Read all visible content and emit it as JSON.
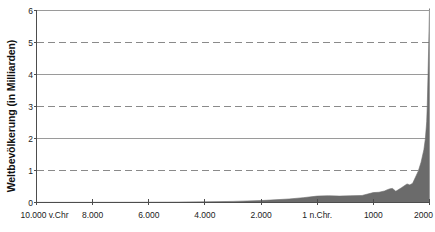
{
  "chart_data": {
    "type": "area",
    "title": "",
    "xlabel": "",
    "ylabel": "Weltbevölkerung (in Milliarden)",
    "ylim": [
      0,
      6
    ],
    "xlim": [
      -10000,
      2000
    ],
    "grid": true,
    "legend": null,
    "series_color": "#6b6b6b",
    "y_ticks": [
      {
        "value": 6,
        "label": "6",
        "gridline": "solid"
      },
      {
        "value": 5,
        "label": "5",
        "gridline": "dashed"
      },
      {
        "value": 4,
        "label": "4",
        "gridline": "solid"
      },
      {
        "value": 3,
        "label": "3",
        "gridline": "dashed"
      },
      {
        "value": 2,
        "label": "2",
        "gridline": "solid"
      },
      {
        "value": 1,
        "label": "1",
        "gridline": "dashed"
      },
      {
        "value": 0,
        "label": "0",
        "gridline": "axis"
      }
    ],
    "x_ticks": [
      {
        "value": -10000,
        "label": "10.000 v.Chr"
      },
      {
        "value": -8000,
        "label": "8.000"
      },
      {
        "value": -6000,
        "label": "6.000"
      },
      {
        "value": -4000,
        "label": "4.000"
      },
      {
        "value": -2000,
        "label": "2.000"
      },
      {
        "value": 1,
        "label": "1 n.Chr."
      },
      {
        "value": 1000,
        "label": "1000"
      },
      {
        "value": 2000,
        "label": "2000"
      }
    ],
    "series": [
      {
        "name": "Weltbevölkerung",
        "x": [
          -10000,
          -9000,
          -8000,
          -7000,
          -6000,
          -5000,
          -4000,
          -3000,
          -2000,
          -1000,
          -500,
          1,
          200,
          400,
          600,
          800,
          1000,
          1100,
          1200,
          1250,
          1300,
          1340,
          1400,
          1500,
          1600,
          1650,
          1700,
          1750,
          1800,
          1850,
          1900,
          1927,
          1950,
          1960,
          1974,
          1987,
          1999,
          2000
        ],
        "values": [
          0.004,
          0.005,
          0.006,
          0.007,
          0.009,
          0.012,
          0.02,
          0.035,
          0.06,
          0.11,
          0.15,
          0.2,
          0.21,
          0.2,
          0.21,
          0.22,
          0.31,
          0.32,
          0.36,
          0.4,
          0.43,
          0.44,
          0.35,
          0.46,
          0.58,
          0.55,
          0.6,
          0.79,
          0.98,
          1.26,
          1.65,
          2.0,
          2.52,
          3.02,
          4.0,
          5.0,
          6.0,
          6.06
        ]
      }
    ]
  }
}
